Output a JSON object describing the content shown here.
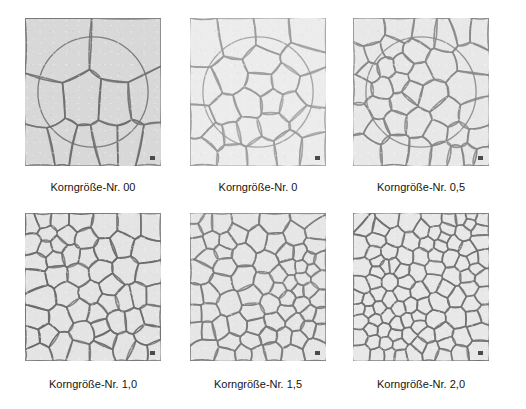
{
  "figure": {
    "background_color": "#ffffff",
    "panel_rows": 2,
    "panel_columns": 3
  },
  "panels": [
    {
      "id": "panel-00",
      "caption": "Korngröße-Nr. 00",
      "grain_count": 12,
      "background_color": "#d8d8d8",
      "line_color": "#6e6e6e",
      "circle_overlay": true,
      "scale_marker": "scale-marker",
      "x": 25,
      "y": 18,
      "width": 136,
      "height": 148
    },
    {
      "id": "panel-0",
      "caption": "Korngröße-Nr. 0",
      "grain_count": 26,
      "background_color": "#ececec",
      "line_color": "#9a9a9a",
      "circle_overlay": true,
      "scale_marker": "scale-marker",
      "x": 190,
      "y": 18,
      "width": 136,
      "height": 148
    },
    {
      "id": "panel-05",
      "caption": "Korngröße-Nr. 0,5",
      "grain_count": 40,
      "background_color": "#e8e8e8",
      "line_color": "#868686",
      "circle_overlay": true,
      "scale_marker": "scale-marker",
      "x": 353,
      "y": 18,
      "width": 136,
      "height": 148
    },
    {
      "id": "panel-10",
      "caption": "Korngröße-Nr. 1,0",
      "grain_count": 54,
      "background_color": "#e4e4e4",
      "line_color": "#6a6a6a",
      "circle_overlay": false,
      "scale_marker": "scale-marker",
      "x": 25,
      "y": 213,
      "width": 136,
      "height": 148
    },
    {
      "id": "panel-15",
      "caption": "Korngröße-Nr. 1,5",
      "grain_count": 74,
      "background_color": "#e6e6e6",
      "line_color": "#7a7a7a",
      "circle_overlay": false,
      "scale_marker": "scale-marker",
      "x": 190,
      "y": 213,
      "width": 136,
      "height": 148
    },
    {
      "id": "panel-20",
      "caption": "Korngröße-Nr. 2,0",
      "grain_count": 104,
      "background_color": "#e8e8e8",
      "line_color": "#707070",
      "circle_overlay": false,
      "scale_marker": "scale-marker",
      "x": 353,
      "y": 213,
      "width": 136,
      "height": 148
    }
  ]
}
